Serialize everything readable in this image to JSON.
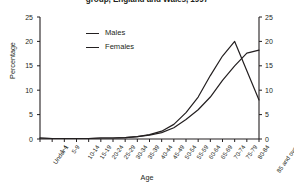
{
  "chart_data": {
    "type": "line",
    "title": "group, England and Wales, 1997",
    "xlabel": "Age",
    "ylabel": "Percentage",
    "ylim": [
      0,
      25
    ],
    "yticks": [
      0,
      5,
      10,
      15,
      20,
      25
    ],
    "grid": false,
    "legend_position": "top-center",
    "dual_y_axis": true,
    "categories": [
      "Under 1",
      "1-4",
      "5-9",
      "10-14",
      "15-19",
      "20-24",
      "25-29",
      "30-34",
      "35-39",
      "40-44",
      "45-49",
      "50-54",
      "55-59",
      "60-64",
      "65-69",
      "70-74",
      "75-79",
      "80-84",
      "85 and over"
    ],
    "series": [
      {
        "name": "Males",
        "values": [
          0.2,
          0.1,
          0.1,
          0.1,
          0.1,
          0.2,
          0.2,
          0.3,
          0.5,
          0.9,
          1.6,
          3.0,
          5.4,
          8.6,
          13.0,
          17.0,
          20.0,
          14.0,
          8.0
        ]
      },
      {
        "name": "Females",
        "values": [
          0.2,
          0.1,
          0.1,
          0.1,
          0.1,
          0.2,
          0.2,
          0.3,
          0.5,
          0.8,
          1.3,
          2.3,
          4.0,
          6.0,
          8.6,
          12.0,
          15.0,
          17.6,
          18.2
        ]
      }
    ]
  },
  "legend": {
    "items": [
      {
        "label": "Males"
      },
      {
        "label": "Females"
      }
    ]
  },
  "colors": {
    "line": "#231f20",
    "axis": "#231f20",
    "background": "#ffffff"
  }
}
